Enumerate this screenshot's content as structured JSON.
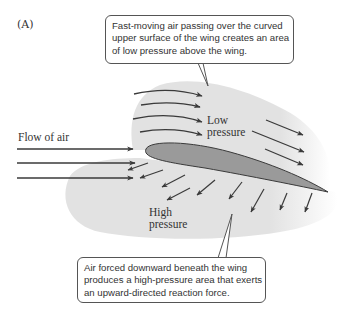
{
  "figure": {
    "panel_label": "(A)",
    "labels": {
      "flow_of_air": "Flow of air",
      "low_pressure": [
        "Low",
        "pressure"
      ],
      "high_pressure": [
        "High",
        "pressure"
      ]
    },
    "callouts": {
      "top": {
        "lines": [
          "Fast-moving air passing over the curved",
          "upper surface of the wing creates an area",
          "of low pressure above the wing."
        ]
      },
      "bottom": {
        "lines": [
          "Air forced downward beneath the wing",
          "produces a high-pressure area that exerts",
          "an upward-directed reaction force."
        ]
      }
    },
    "colors": {
      "background": "#ffffff",
      "region_shade": "#e2e2e2",
      "wing_fill": "#9a9a9a",
      "wing_stroke": "#3a3a3a",
      "arrow": "#3a3a3a",
      "callout_border": "#555555",
      "text": "#333333"
    },
    "elements": {
      "wing": "airfoil cross-section",
      "incoming_arrows": 3,
      "upper_curved_arrows": 4,
      "upper_right_arrows": 3,
      "downward_arrows": 9
    }
  }
}
